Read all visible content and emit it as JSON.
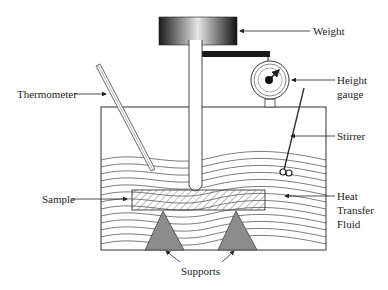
{
  "diagram": {
    "labels": {
      "weight": "Weight",
      "height_gauge_line1": "Height",
      "height_gauge_line2": "gauge",
      "thermometer": "Thermometer",
      "stirrer": "Stirrer",
      "sample": "Sample",
      "fluid_line1": "Heat",
      "fluid_line2": "Transfer",
      "fluid_line3": "Fluid",
      "supports": "Supports"
    },
    "colors": {
      "line": "#333333",
      "support_fill": "#8c8c8c",
      "bar": "#1a1a1a",
      "weight_dark": "#1a1a1a",
      "weight_light": "#e6e6e6"
    }
  }
}
